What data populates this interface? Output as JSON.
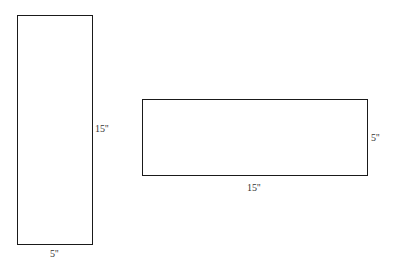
{
  "shapes": [
    {
      "name": "tall-rectangle",
      "width_label": "5''",
      "height_label": "15''"
    },
    {
      "name": "wide-rectangle",
      "width_label": "15''",
      "height_label": "5''"
    }
  ]
}
